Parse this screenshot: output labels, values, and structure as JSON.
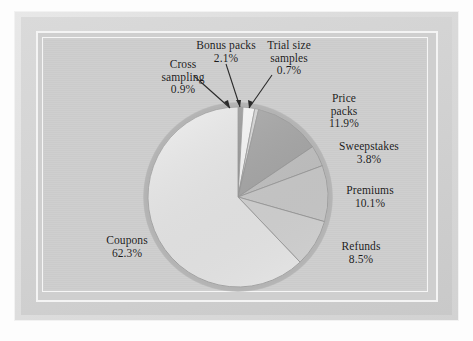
{
  "chart_data": {
    "type": "pie",
    "title": "",
    "subtitle": "",
    "xlabel": "",
    "ylabel": "",
    "units": "percent",
    "legend_position": "none",
    "grid": false,
    "labels_inline": true,
    "start_angle_deg": 0,
    "direction": "clockwise",
    "center": {
      "x": 238,
      "y": 197
    },
    "radius": 90,
    "categories": [
      "Cross sampling",
      "Bonus packs",
      "Trial size samples",
      "Price packs",
      "Sweepstakes",
      "Premiums",
      "Refunds",
      "Coupons"
    ],
    "values": [
      0.9,
      2.1,
      0.7,
      11.9,
      3.8,
      10.1,
      8.5,
      62.3
    ],
    "value_labels": [
      "0.9%",
      "2.1%",
      "0.7%",
      "11.9%",
      "3.8%",
      "10.1%",
      "8.5%",
      "62.3%"
    ],
    "colors": [
      "#9c9c9c",
      "#fdfdfd",
      "#dcdcdc",
      "#a9a9a9",
      "#c6c6c6",
      "#cfcfcf",
      "#d8d8d8",
      "#ededed"
    ],
    "slices": [
      {
        "name": "Cross sampling",
        "value": 0.9,
        "label": "Cross sampling",
        "value_label": "0.9%",
        "color": "#9c9c9c"
      },
      {
        "name": "Bonus packs",
        "value": 2.1,
        "label": "Bonus packs",
        "value_label": "2.1%",
        "color": "#fdfdfd"
      },
      {
        "name": "Trial size samples",
        "value": 0.7,
        "label": "Trial size samples",
        "value_label": "0.7%",
        "color": "#dcdcdc"
      },
      {
        "name": "Price packs",
        "value": 11.9,
        "label": "Price packs",
        "value_label": "11.9%",
        "color": "#a9a9a9"
      },
      {
        "name": "Sweepstakes",
        "value": 3.8,
        "label": "Sweepstakes",
        "value_label": "3.8%",
        "color": "#c6c6c6"
      },
      {
        "name": "Premiums",
        "value": 10.1,
        "label": "Premiums",
        "value_label": "10.1%",
        "color": "#cfcfcf"
      },
      {
        "name": "Refunds",
        "value": 8.5,
        "label": "Refunds",
        "value_label": "8.5%",
        "color": "#d8d8d8"
      },
      {
        "name": "Coupons",
        "value": 62.3,
        "label": "Coupons",
        "value_label": "62.3%",
        "color": "#ededed"
      }
    ]
  },
  "labels": {
    "cross_sampling": {
      "line1": "Cross",
      "line2": "sampling",
      "value": "0.9%"
    },
    "bonus_packs": {
      "line1": "Bonus packs",
      "line2": "",
      "value": "2.1%"
    },
    "trial_size": {
      "line1": "Trial size",
      "line2": "samples",
      "value": "0.7%"
    },
    "price_packs": {
      "line1": "Price",
      "line2": "packs",
      "value": "11.9%"
    },
    "sweepstakes": {
      "line1": "Sweepstakes",
      "line2": "",
      "value": "3.8%"
    },
    "premiums": {
      "line1": "Premiums",
      "line2": "",
      "value": "10.1%"
    },
    "refunds": {
      "line1": "Refunds",
      "line2": "",
      "value": "8.5%"
    },
    "coupons": {
      "line1": "Coupons",
      "line2": "",
      "value": "62.3%"
    }
  },
  "style": {
    "panel_color": "#cdcdcd",
    "frame_color": "#dcdcdc",
    "ring_color": "#b4b4b4",
    "text_color": "#1b1b1b",
    "leader_color": "#2a2a2a"
  }
}
